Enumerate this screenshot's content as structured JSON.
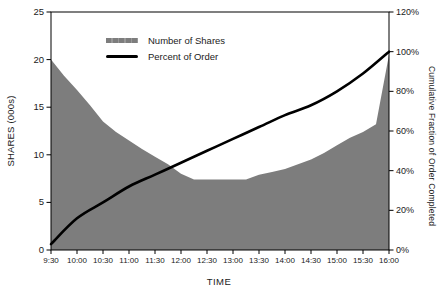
{
  "chart_data": {
    "type": "area",
    "title": "",
    "grid": false,
    "legend_position": "top-center-inside",
    "plot_background": "#ffffff",
    "frame_color": "#000000",
    "x_axis": {
      "title": "TIME",
      "tick_labels": [
        "9:30",
        "10:00",
        "10:30",
        "11:00",
        "11:30",
        "12:00",
        "12:30",
        "13:00",
        "13:30",
        "14:00",
        "14:30",
        "15:00",
        "15:30",
        "16:00"
      ],
      "range_minutes": [
        0,
        390
      ]
    },
    "left_axis": {
      "title": "SHARES (000s)",
      "min": 0,
      "max": 25,
      "tick_values": [
        0,
        5,
        10,
        15,
        20,
        25
      ],
      "tick_labels": [
        "0",
        "5",
        "10",
        "15",
        "20",
        "25"
      ]
    },
    "right_axis": {
      "title": "Cumulative Fraction of Order Completed",
      "min": 0,
      "max": 120,
      "tick_values": [
        0,
        20,
        40,
        60,
        80,
        100,
        120
      ],
      "tick_labels": [
        "0%",
        "20%",
        "40%",
        "60%",
        "80%",
        "100%",
        "120%"
      ]
    },
    "series": [
      {
        "name": "Number of Shares",
        "type": "area",
        "axis": "left",
        "color": "#7d7d7d",
        "x_minutes": [
          0,
          15,
          30,
          45,
          60,
          75,
          90,
          105,
          120,
          135,
          150,
          165,
          180,
          195,
          210,
          225,
          240,
          255,
          270,
          285,
          300,
          315,
          330,
          345,
          360,
          375,
          390
        ],
        "values": [
          20.0,
          18.3,
          16.8,
          15.2,
          13.5,
          12.4,
          11.5,
          10.6,
          9.8,
          9.0,
          8.0,
          7.4,
          7.4,
          7.4,
          7.4,
          7.4,
          7.9,
          8.2,
          8.5,
          9.0,
          9.5,
          10.2,
          11.0,
          11.8,
          12.4,
          13.2,
          20.5
        ]
      },
      {
        "name": "Percent of Order",
        "type": "line",
        "axis": "right",
        "color": "#000000",
        "x_minutes": [
          0,
          30,
          60,
          90,
          120,
          150,
          180,
          210,
          240,
          270,
          300,
          330,
          360,
          390
        ],
        "values": [
          3,
          16,
          24,
          32,
          38,
          44,
          50,
          56,
          62,
          68,
          73,
          80,
          89,
          100
        ]
      }
    ]
  }
}
